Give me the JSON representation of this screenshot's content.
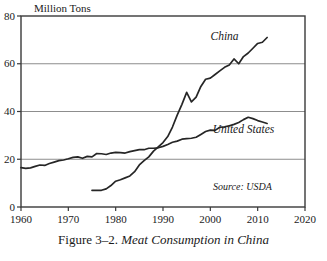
{
  "caption": {
    "number": "Figure 3–2.",
    "title": "Meat Consumption in China"
  },
  "chart_data": {
    "type": "line",
    "title": "",
    "subtitle": "",
    "xlabel": "",
    "ylabel": "Million Tons",
    "xlim": [
      1960,
      2020
    ],
    "ylim": [
      0,
      80
    ],
    "xticks": [
      1960,
      1970,
      1980,
      1990,
      2000,
      2010,
      2020
    ],
    "yticks": [
      0,
      20,
      40,
      60,
      80
    ],
    "xtick_labels": [
      "1960",
      "1970",
      "1980",
      "1990",
      "2000",
      "2010",
      "2020"
    ],
    "ytick_labels": [
      "0",
      "20",
      "40",
      "60",
      "80"
    ],
    "grid": "horizontal",
    "gridlines_at": [
      20,
      40,
      60
    ],
    "legend_position": "inline-annotation",
    "annotations": [
      {
        "text": "China",
        "x": 2003,
        "y": 70
      },
      {
        "text": "United States",
        "x": 2007,
        "y": 31
      },
      {
        "text": "Source: USDA",
        "x": 2013,
        "y": 7
      }
    ],
    "series": [
      {
        "name": "China",
        "color": "#262626",
        "x": [
          1975,
          1976,
          1977,
          1978,
          1979,
          1980,
          1981,
          1982,
          1983,
          1984,
          1985,
          1986,
          1987,
          1988,
          1989,
          1990,
          1991,
          1992,
          1993,
          1994,
          1995,
          1996,
          1997,
          1998,
          1999,
          2000,
          2001,
          2002,
          2003,
          2004,
          2005,
          2006,
          2007,
          2008,
          2009,
          2010,
          2011,
          2012
        ],
        "values": [
          7.0,
          7.0,
          7.0,
          7.6,
          9.0,
          10.8,
          11.4,
          12.2,
          13.0,
          14.8,
          17.6,
          19.4,
          21.0,
          23.4,
          25.2,
          27.0,
          29.5,
          33.5,
          38.5,
          43.0,
          48.0,
          44.0,
          46.0,
          50.5,
          53.5,
          54.0,
          55.5,
          57.0,
          58.5,
          59.5,
          62.0,
          60.0,
          63.0,
          64.5,
          66.5,
          68.5,
          69.0,
          71.0
        ]
      },
      {
        "name": "United States",
        "color": "#262626",
        "x": [
          1960,
          1961,
          1962,
          1963,
          1964,
          1965,
          1966,
          1967,
          1968,
          1969,
          1970,
          1971,
          1972,
          1973,
          1974,
          1975,
          1976,
          1977,
          1978,
          1979,
          1980,
          1981,
          1982,
          1983,
          1984,
          1985,
          1986,
          1987,
          1988,
          1989,
          1990,
          1991,
          1992,
          1993,
          1994,
          1995,
          1996,
          1997,
          1998,
          1999,
          2000,
          2001,
          2002,
          2003,
          2004,
          2005,
          2006,
          2007,
          2008,
          2009,
          2010,
          2011,
          2012
        ],
        "values": [
          16.5,
          16.2,
          16.4,
          17.0,
          17.6,
          17.4,
          18.2,
          18.8,
          19.4,
          19.7,
          20.2,
          20.8,
          21.0,
          20.4,
          21.2,
          21.0,
          22.4,
          22.3,
          22.0,
          22.6,
          22.9,
          22.8,
          22.6,
          23.2,
          23.6,
          24.0,
          24.0,
          24.6,
          24.6,
          24.8,
          25.4,
          26.2,
          27.1,
          27.6,
          28.4,
          28.6,
          28.8,
          29.2,
          30.4,
          31.6,
          32.2,
          32.1,
          33.4,
          33.6,
          34.0,
          34.6,
          35.4,
          36.6,
          37.6,
          37.0,
          36.2,
          35.6,
          35.0
        ]
      }
    ]
  }
}
